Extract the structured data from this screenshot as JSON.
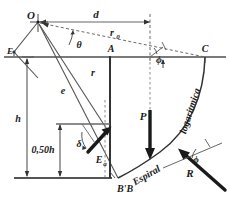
{
  "figure": {
    "name": "logarithmic-spiral-earth-pressure-diagram",
    "type": "engineering-free-body-diagram",
    "language": "pt",
    "colors": {
      "ink": "#1a1a1a",
      "ground_line": "#7a7a7a",
      "thin_line": "#5a5a5a",
      "dashed": "#6b6b6b",
      "background": "#ffffff"
    }
  },
  "labels": {
    "origin_point": "O",
    "point_a": "A",
    "point_c": "C",
    "point_b": "B'B",
    "point_e_left": "E",
    "distance_d": "d",
    "radius_r0": "r",
    "radius_r0_sub": "0",
    "radius_r": "r",
    "angle_theta": "θ",
    "eccentricity_e": "e",
    "height_h": "h",
    "height_half": "0,50h",
    "angle_delta": "δ",
    "force_ea": "E",
    "force_ea_sub": "a",
    "force_p": "P",
    "force_r": "R",
    "angle_phi_top": "ϕ",
    "angle_phi_bottom": "ϕ",
    "curve_name_1": "Espiral",
    "curve_name_2": "logaritmica"
  },
  "geometry": {
    "origin": [
      38,
      22
    ],
    "point_a": [
      110,
      57
    ],
    "point_c": [
      205,
      57
    ],
    "point_b": [
      110,
      178
    ],
    "ground_y": 57,
    "base_y": 178,
    "spiral_start": [
      205,
      57
    ],
    "spiral_end": [
      118,
      178
    ]
  }
}
